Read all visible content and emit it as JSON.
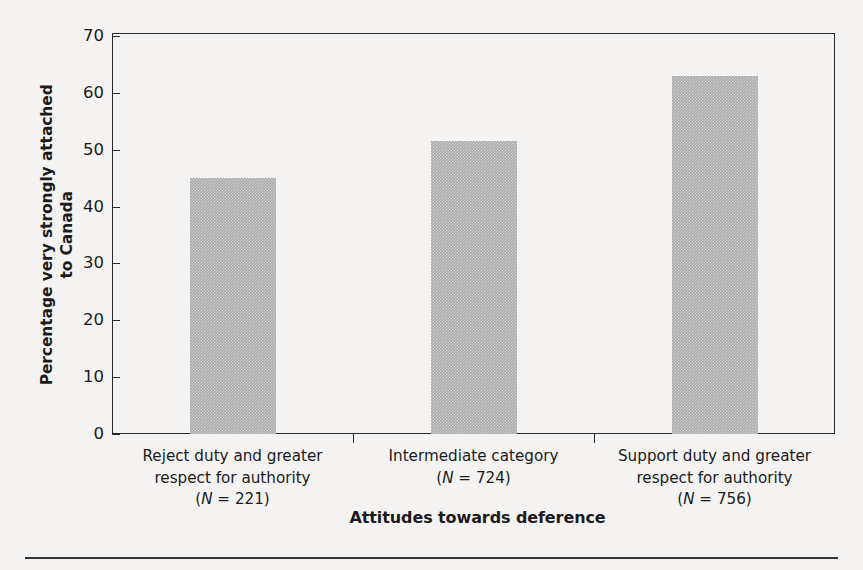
{
  "chart_data": {
    "type": "bar",
    "title": "",
    "xlabel": "Attitudes towards deference",
    "ylabel_line1": "Percentage very strongly attached",
    "ylabel_line2": "to Canada",
    "categories": [
      "Reject duty and greater respect for authority",
      "Intermediate category",
      "Support duty and greater respect for authority"
    ],
    "category_lines": [
      [
        "Reject duty and greater",
        "respect for authority",
        "(N = 221)"
      ],
      [
        "Intermediate category",
        "(N = 724)"
      ],
      [
        "Support duty and greater",
        "respect for authority",
        "(N = 756)"
      ]
    ],
    "sample_sizes": [
      221,
      724,
      756
    ],
    "values": [
      45.0,
      51.5,
      63.0
    ],
    "ylim": [
      0,
      70
    ],
    "yticks": [
      0,
      10,
      20,
      30,
      40,
      50,
      60,
      70
    ],
    "ytick_labels": [
      "0",
      "10",
      "20",
      "30",
      "40",
      "50",
      "60",
      "70"
    ],
    "grid": false,
    "legend": "none",
    "bar_color": "#a9a9a9",
    "axis_color": "#2b2b2b",
    "background_color": "#f4f3f1"
  }
}
